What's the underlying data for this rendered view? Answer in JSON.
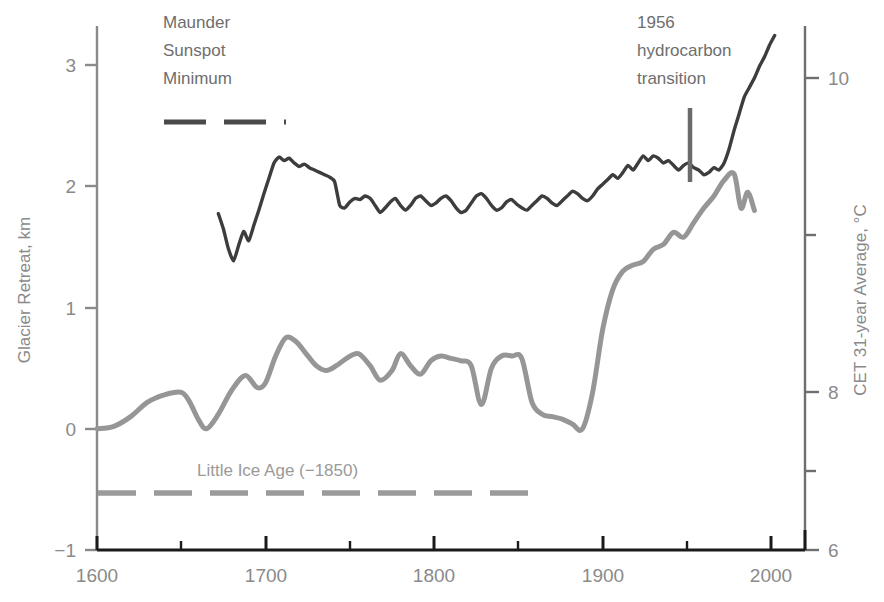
{
  "chart_data": {
    "type": "line",
    "title": "",
    "xlabel": "",
    "xlim": [
      1600,
      2020
    ],
    "xticks": [
      1600,
      1700,
      1800,
      1900,
      2000
    ],
    "xminorticks": [
      1650,
      1750,
      1850,
      1950
    ],
    "grid": false,
    "legend_position": "none",
    "axes": [
      {
        "id": "left",
        "label": "Glacier Retreat, km",
        "ylim": [
          -1,
          3.35
        ],
        "yticks": [
          -1,
          0,
          1,
          2,
          3
        ],
        "ytick_labels": [
          "−1",
          "0",
          "1",
          "2",
          "3"
        ],
        "color": "#8a8a8a"
      },
      {
        "id": "right",
        "label": "CET 31-year Average, °C",
        "ylim": [
          6,
          10.87
        ],
        "yticks": [
          6,
          7,
          8,
          9,
          10
        ],
        "ytick_labels": [
          "6",
          "",
          "8",
          "",
          "10"
        ],
        "labeled_ticks": [
          6,
          8,
          10
        ],
        "minor_ticks": [
          7,
          9
        ],
        "color": "#8a8a8a"
      }
    ],
    "series": [
      {
        "name": "CET 31-year Average",
        "axis": "right",
        "color": "#3d3d3d",
        "unit": "°C",
        "x": [
          1672,
          1675,
          1678,
          1681,
          1684,
          1687,
          1690,
          1693,
          1696,
          1699,
          1702,
          1705,
          1708,
          1711,
          1714,
          1717,
          1720,
          1723,
          1726,
          1729,
          1732,
          1735,
          1738,
          1741,
          1744,
          1747,
          1750,
          1753,
          1756,
          1759,
          1762,
          1765,
          1768,
          1771,
          1774,
          1777,
          1780,
          1783,
          1786,
          1789,
          1792,
          1795,
          1798,
          1801,
          1804,
          1807,
          1810,
          1813,
          1816,
          1819,
          1822,
          1825,
          1828,
          1831,
          1834,
          1837,
          1840,
          1843,
          1846,
          1849,
          1852,
          1855,
          1858,
          1861,
          1864,
          1867,
          1870,
          1873,
          1876,
          1879,
          1882,
          1885,
          1888,
          1891,
          1894,
          1897,
          1900,
          1903,
          1906,
          1909,
          1912,
          1915,
          1918,
          1921,
          1924,
          1927,
          1930,
          1933,
          1936,
          1939,
          1942,
          1945,
          1948,
          1951,
          1954,
          1957,
          1960,
          1963,
          1966,
          1969,
          1972,
          1975,
          1978,
          1981,
          1984,
          1987,
          1990,
          1993,
          1996,
          1999,
          2002
        ],
        "y": [
          8.85,
          8.72,
          8.55,
          8.45,
          8.58,
          8.7,
          8.62,
          8.75,
          8.88,
          9.02,
          9.15,
          9.28,
          9.33,
          9.3,
          9.32,
          9.28,
          9.25,
          9.27,
          9.24,
          9.22,
          9.2,
          9.18,
          9.16,
          9.12,
          8.92,
          8.9,
          8.95,
          8.98,
          8.97,
          9.0,
          8.98,
          8.92,
          8.86,
          8.9,
          8.95,
          8.98,
          8.92,
          8.88,
          8.92,
          8.98,
          9.0,
          8.96,
          8.92,
          8.94,
          8.98,
          9.0,
          8.96,
          8.9,
          8.86,
          8.88,
          8.94,
          9.0,
          9.02,
          8.98,
          8.92,
          8.88,
          8.9,
          8.95,
          8.97,
          8.93,
          8.9,
          8.88,
          8.92,
          8.96,
          9.0,
          8.98,
          8.94,
          8.92,
          8.96,
          9.0,
          9.04,
          9.02,
          8.98,
          8.96,
          9.0,
          9.06,
          9.1,
          9.14,
          9.18,
          9.15,
          9.2,
          9.26,
          9.22,
          9.28,
          9.34,
          9.3,
          9.34,
          9.32,
          9.28,
          9.3,
          9.26,
          9.22,
          9.26,
          9.28,
          9.24,
          9.22,
          9.18,
          9.2,
          9.24,
          9.22,
          9.28,
          9.4,
          9.56,
          9.7,
          9.84,
          9.92,
          10.0,
          10.1,
          10.18,
          10.28,
          10.36
        ]
      },
      {
        "name": "Glacier Retreat",
        "axis": "left",
        "color": "#969696",
        "unit": "km",
        "x": [
          1600,
          1610,
          1620,
          1630,
          1640,
          1650,
          1655,
          1660,
          1665,
          1672,
          1680,
          1688,
          1695,
          1700,
          1706,
          1712,
          1718,
          1724,
          1730,
          1736,
          1742,
          1748,
          1755,
          1762,
          1768,
          1775,
          1780,
          1786,
          1792,
          1798,
          1804,
          1810,
          1816,
          1822,
          1828,
          1834,
          1840,
          1846,
          1852,
          1858,
          1864,
          1870,
          1876,
          1882,
          1888,
          1894,
          1900,
          1906,
          1912,
          1918,
          1924,
          1930,
          1936,
          1942,
          1948,
          1954,
          1960,
          1966,
          1972,
          1978,
          1982,
          1986,
          1990
        ],
        "y": [
          0.0,
          0.02,
          0.1,
          0.22,
          0.28,
          0.3,
          0.22,
          0.08,
          0.0,
          0.12,
          0.32,
          0.44,
          0.34,
          0.38,
          0.6,
          0.75,
          0.72,
          0.62,
          0.52,
          0.48,
          0.52,
          0.58,
          0.62,
          0.52,
          0.4,
          0.48,
          0.62,
          0.52,
          0.45,
          0.56,
          0.6,
          0.58,
          0.56,
          0.52,
          0.2,
          0.5,
          0.6,
          0.6,
          0.58,
          0.22,
          0.12,
          0.1,
          0.08,
          0.04,
          0.0,
          0.3,
          0.82,
          1.15,
          1.3,
          1.35,
          1.38,
          1.48,
          1.52,
          1.62,
          1.58,
          1.7,
          1.82,
          1.92,
          2.05,
          2.1,
          1.82,
          1.95,
          1.8
        ]
      }
    ],
    "annotations": [
      {
        "id": "maunder",
        "text_lines": [
          "Maunder",
          "Sunspot",
          "Minimum"
        ],
        "text_color": "#6e6e6e",
        "marker": "dashed-horizontal-bar",
        "marker_color": "#4a4a4a",
        "x_start": 1640,
        "x_end": 1715,
        "y_value": 9.55,
        "y_axis": "right"
      },
      {
        "id": "hydrocarbon",
        "text_lines": [
          "1956",
          "hydrocarbon",
          "transition"
        ],
        "text_color": "#6e6e6e",
        "marker": "vertical-line",
        "marker_color": "#6b6b6b",
        "x_value": 1956,
        "y_top": 9.7,
        "y_bottom": 8.7,
        "y_axis": "right"
      },
      {
        "id": "little-ice-age",
        "text_lines": [
          "Little Ice Age (−1850)"
        ],
        "text_color": "#9a9a9a",
        "marker": "dashed-horizontal-bar",
        "marker_color": "#9a9a9a",
        "x_start": 1600,
        "x_end": 1850,
        "y_value": -0.52,
        "y_axis": "left"
      }
    ]
  },
  "labels": {
    "left_axis_title": "Glacier Retreat, km",
    "right_axis_title": "CET 31-year Average, °C",
    "xtick_1600": "1600",
    "xtick_1700": "1700",
    "xtick_1800": "1800",
    "xtick_1900": "1900",
    "xtick_2000": "2000",
    "ytick_left_m1": "−1",
    "ytick_left_0": "0",
    "ytick_left_1": "1",
    "ytick_left_2": "2",
    "ytick_left_3": "3",
    "ytick_right_6": "6",
    "ytick_right_8": "8",
    "ytick_right_10": "10",
    "maunder_line1": "Maunder",
    "maunder_line2": "Sunspot",
    "maunder_line3": "Minimum",
    "hydro_line1": "1956",
    "hydro_line2": "hydrocarbon",
    "hydro_line3": "transition",
    "little_ice_age": "Little Ice Age (−1850)"
  },
  "colors": {
    "cet_curve": "#3d3d3d",
    "glacier_curve": "#969696",
    "left_axis": "#8a8a8a",
    "right_axis": "#6e6e6e",
    "bottom_axis": "#1a1a1a",
    "background": "#ffffff"
  }
}
